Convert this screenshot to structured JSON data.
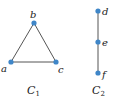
{
  "colors": {
    "node": "#3f86c8",
    "edge": "#555555",
    "text": "#222222"
  },
  "graphs": [
    {
      "caption": "C",
      "caption_sub": "1",
      "vertices": [
        {
          "id": "a",
          "label": "a"
        },
        {
          "id": "b",
          "label": "b"
        },
        {
          "id": "c",
          "label": "c"
        }
      ],
      "edges": [
        [
          "a",
          "b"
        ],
        [
          "b",
          "c"
        ],
        [
          "a",
          "c"
        ]
      ]
    },
    {
      "caption": "C",
      "caption_sub": "2",
      "vertices": [
        {
          "id": "d",
          "label": "d"
        },
        {
          "id": "e",
          "label": "e"
        },
        {
          "id": "f",
          "label": "f"
        }
      ],
      "edges": [
        [
          "d",
          "e"
        ],
        [
          "e",
          "f"
        ]
      ]
    }
  ]
}
